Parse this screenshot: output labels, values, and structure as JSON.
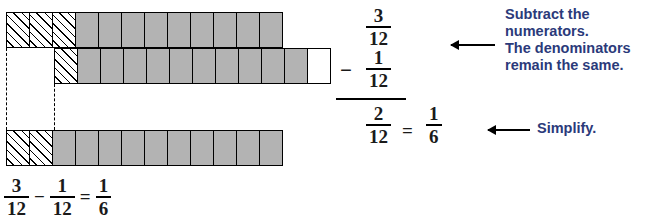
{
  "model": {
    "total_parts": 12,
    "rows": [
      {
        "name": "minuend-bar",
        "label": "3/12 shown as 3 hatched parts then 9 shaded parts",
        "hatched": 3,
        "shaded": 9,
        "white": 0
      },
      {
        "name": "subtrahend-bar",
        "label": "1/12 removed shown as 1 hatched part",
        "hatched": 1,
        "shaded": 10,
        "white": 1
      },
      {
        "name": "difference-bar",
        "label": "2/12 remaining shown as 2 hatched parts",
        "hatched": 2,
        "shaded": 10,
        "white": 0
      }
    ]
  },
  "equation": {
    "minuend": {
      "numerator": "3",
      "denominator": "12"
    },
    "operator": "−",
    "subtrahend": {
      "numerator": "1",
      "denominator": "12"
    },
    "result": {
      "numerator": "2",
      "denominator": "12"
    },
    "equals": "=",
    "simplified": {
      "numerator": "1",
      "denominator": "6"
    }
  },
  "callouts": [
    {
      "name": "subtract-numerators-callout",
      "line1": "Subtract the",
      "line2": "numerators.",
      "line3": "The denominators",
      "line4": "remain the same."
    },
    {
      "name": "simplify-callout",
      "text": "Simplify."
    }
  ],
  "bottom_equation": {
    "minuend": {
      "numerator": "3",
      "denominator": "12"
    },
    "minus": "−",
    "subtrahend": {
      "numerator": "1",
      "denominator": "12"
    },
    "equals": "=",
    "result": {
      "numerator": "1",
      "denominator": "6"
    }
  },
  "colors": {
    "shaded_part": "#b3b3b3",
    "outline": "#000000",
    "callout_text": "#2b3a7a",
    "background": "#ffffff"
  }
}
